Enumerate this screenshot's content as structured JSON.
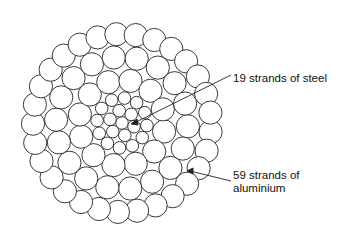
{
  "diagram": {
    "labels": {
      "steel": "19 strands of steel",
      "aluminium_line1": "59 strands of",
      "aluminium_line2": "aluminium"
    },
    "stroke_color": "#222222",
    "background": "#ffffff",
    "steel_strand_count": 19,
    "aluminium_strand_count": 59
  }
}
